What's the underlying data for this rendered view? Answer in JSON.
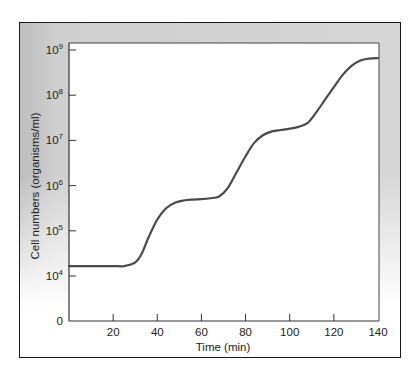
{
  "chart_data": {
    "type": "line",
    "title": "",
    "xlabel": "Time (min)",
    "ylabel": "Cell numbers (organisms/ml)",
    "xlim": [
      0,
      140
    ],
    "yscale": "log",
    "x_ticks": [
      20,
      40,
      60,
      80,
      100,
      120,
      140
    ],
    "y_ticks": [
      {
        "label_base": "0",
        "label_exp": "",
        "exp": 3
      },
      {
        "label_base": "10",
        "label_exp": "4",
        "exp": 4
      },
      {
        "label_base": "10",
        "label_exp": "5",
        "exp": 5
      },
      {
        "label_base": "10",
        "label_exp": "6",
        "exp": 6
      },
      {
        "label_base": "10",
        "label_exp": "7",
        "exp": 7
      },
      {
        "label_base": "10",
        "label_exp": "8",
        "exp": 8
      },
      {
        "label_base": "10",
        "label_exp": "9",
        "exp": 9
      }
    ],
    "grid": false,
    "legend": null,
    "series": [
      {
        "name": "Synchronous growth",
        "x": [
          0,
          10,
          20,
          25,
          30,
          33,
          36,
          40,
          44,
          48,
          52,
          56,
          60,
          64,
          68,
          72,
          76,
          80,
          84,
          88,
          92,
          96,
          100,
          104,
          108,
          112,
          116,
          120,
          124,
          128,
          132,
          136,
          140
        ],
        "log10_y": [
          4.22,
          4.22,
          4.22,
          4.22,
          4.3,
          4.5,
          4.85,
          5.25,
          5.5,
          5.62,
          5.67,
          5.69,
          5.7,
          5.72,
          5.76,
          5.95,
          6.3,
          6.65,
          6.95,
          7.12,
          7.2,
          7.23,
          7.26,
          7.3,
          7.38,
          7.62,
          7.9,
          8.18,
          8.45,
          8.65,
          8.77,
          8.81,
          8.82
        ]
      }
    ]
  }
}
